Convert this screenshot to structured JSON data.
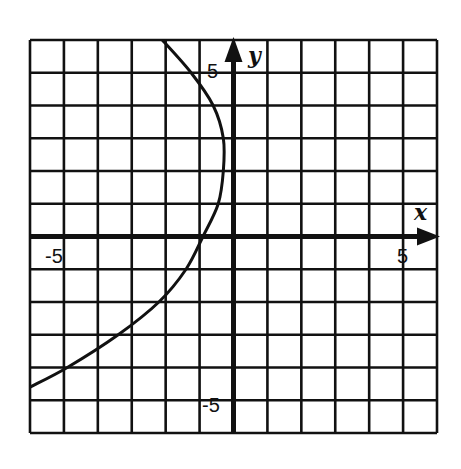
{
  "chart_data": {
    "type": "line",
    "title": "",
    "xlabel": "x",
    "ylabel": "y",
    "xlim": [
      -6,
      6
    ],
    "ylim": [
      -6,
      6
    ],
    "grid": true,
    "grid_step": 1,
    "tick_labels": {
      "x": [
        {
          "value": -5,
          "label": "-5"
        },
        {
          "value": 5,
          "label": "5"
        }
      ],
      "y": [
        {
          "value": 5,
          "label": "5"
        },
        {
          "value": -5,
          "label": "-5"
        }
      ]
    },
    "series": [
      {
        "name": "curve",
        "points": [
          {
            "x": -2.1,
            "y": 6
          },
          {
            "x": -1.25,
            "y": 5
          },
          {
            "x": -0.6,
            "y": 4
          },
          {
            "x": -0.3,
            "y": 3
          },
          {
            "x": -0.3,
            "y": 2
          },
          {
            "x": -0.45,
            "y": 1
          },
          {
            "x": -0.9,
            "y": 0
          },
          {
            "x": -1.4,
            "y": -1
          },
          {
            "x": -2.2,
            "y": -2
          },
          {
            "x": -3.4,
            "y": -3
          },
          {
            "x": -4.9,
            "y": -4
          },
          {
            "x": -6,
            "y": -4.6
          }
        ]
      }
    ],
    "legend": null
  },
  "labels": {
    "x_axis": "x",
    "y_axis": "y",
    "x_neg5": "-5",
    "x_pos5": "5",
    "y_pos5": "5",
    "y_neg5": "-5"
  },
  "colors": {
    "ink": "#111111",
    "background": "#ffffff"
  }
}
